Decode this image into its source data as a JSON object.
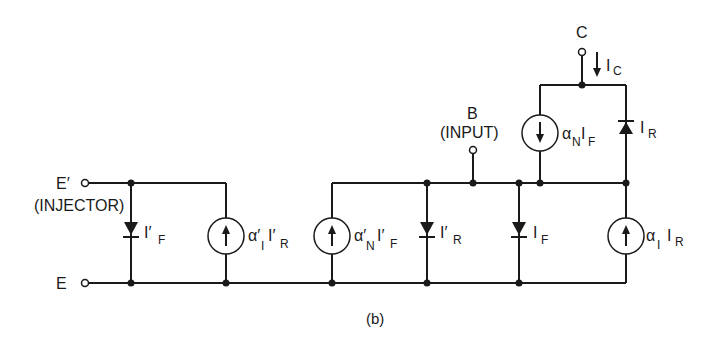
{
  "figure": {
    "caption": "(b)",
    "ink_color": "#1a1a1a",
    "background": "#ffffff"
  },
  "terminals": {
    "e_prime": {
      "label": "E′",
      "sublabel": "(INJECTOR)"
    },
    "e": {
      "label": "E"
    },
    "b": {
      "label": "B",
      "sublabel": "(INPUT)"
    },
    "c": {
      "label": "C"
    }
  },
  "currents": {
    "collector": {
      "main": "I",
      "sub": "C"
    }
  },
  "components": {
    "diode_if_prime": {
      "main": "I′",
      "sub": "F"
    },
    "source_alpha_i_prime": {
      "alpha": "α′",
      "alpha_sub": "I",
      "main": "I′",
      "sub": "R"
    },
    "source_alpha_n_prime": {
      "alpha": "α′",
      "alpha_sub": "N",
      "main": "I′",
      "sub": "F"
    },
    "diode_ir_prime": {
      "main": "I′",
      "sub": "R"
    },
    "diode_if": {
      "main": "I",
      "sub": "F"
    },
    "source_alpha_n": {
      "alpha": "α",
      "alpha_sub": "N",
      "main": "I",
      "sub": "F"
    },
    "diode_ir": {
      "main": "I",
      "sub": "R"
    },
    "source_alpha_i": {
      "alpha": "α",
      "alpha_sub": "I",
      "main": "I",
      "sub": "R"
    }
  }
}
